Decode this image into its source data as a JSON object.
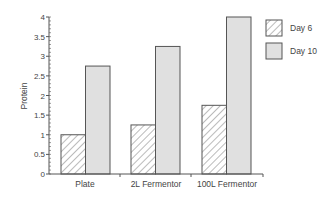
{
  "chart_data": {
    "type": "bar",
    "title": "",
    "xlabel": "",
    "ylabel": "Protein",
    "ylim": [
      0,
      4
    ],
    "yticks": [
      "0",
      "0.5",
      "1",
      "1.5",
      "2",
      "2.5",
      "3",
      "3.5",
      "4"
    ],
    "categories": [
      "Plate",
      "2L Fermentor",
      "100L Fermentor"
    ],
    "series": [
      {
        "name": "Day 6",
        "values": [
          1.0,
          1.25,
          1.75
        ],
        "pattern": "hatched"
      },
      {
        "name": "Day 10",
        "values": [
          2.75,
          3.25,
          4.0
        ],
        "pattern": "solid",
        "color": "#e0e0e0"
      }
    ],
    "grid": false,
    "legend_position": "top-right"
  },
  "colors": {
    "axis": "#555555",
    "bar_outline": "#555555",
    "day10_fill": "#e0e0e0",
    "hatch": "#777777"
  }
}
